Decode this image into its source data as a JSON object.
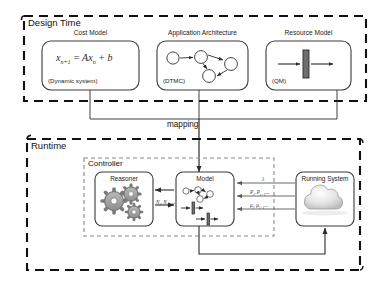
{
  "diagram": {
    "title_design": "Design Time",
    "title_runtime": "Runtime",
    "mapping_label": "mapping",
    "controller_label": "Controller"
  },
  "design_time": {
    "boxes": [
      {
        "title": "Cost Model",
        "content_kind": "formula",
        "formula_plain": "x n+1 = Ax n + b",
        "formula_lhs": "x",
        "formula_lhs_sub": "n+1",
        "formula_mid": " = Ax",
        "formula_mid_sub": "n",
        "formula_tail": " + b",
        "caption": "(Dynamic system)"
      },
      {
        "title": "Application Architecture",
        "content_kind": "dtmc-graph",
        "caption": "(DTMC)"
      },
      {
        "title": "Resource Model",
        "content_kind": "queue-symbol",
        "caption": "(QM)"
      }
    ]
  },
  "runtime": {
    "controller": {
      "label": "Controller",
      "nodes": [
        {
          "title": "Reasoner",
          "icon": "gears-icon"
        },
        {
          "title": "Model",
          "icon": "model-composite-icon"
        }
      ]
    },
    "running_system": {
      "title": "Running System",
      "icon": "cloud-icon"
    },
    "edge_labels": {
      "reasoner_to_model": {
        "base": "N",
        "sub1": "i",
        "sep": ", ",
        "base2": "N",
        "sub2": "i+1",
        "tail": "..."
      },
      "arrival_rate": {
        "base": "λ",
        "sub1": "",
        "tail": ""
      },
      "probabilities": {
        "base": "P",
        "sub1": "i",
        "sep": ", ",
        "base2": "P",
        "sub2": "i+1",
        "tail": "..."
      },
      "service_rates": {
        "base": "μ",
        "sub1": "i",
        "sep": ", ",
        "base2": "μ",
        "sub2": "i+1",
        "tail": "..."
      }
    }
  },
  "colors": {
    "stroke": "#2b2b2b",
    "dashed_border": "#111111",
    "box_border": "#3a3a3a",
    "background": "#ffffff",
    "icon_gray": "#8c8c8c",
    "label_gray": "#3a3a3a"
  }
}
